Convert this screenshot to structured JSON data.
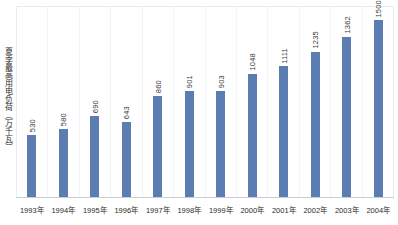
{
  "chart_data": {
    "type": "bar",
    "title": "",
    "subtitle": "",
    "xlabel": "",
    "ylabel": "夏季最高用电负荷（万千瓦）",
    "ylim": [
      0,
      1620
    ],
    "grid": "vertical-only",
    "legend": "none",
    "orientation": "vertical",
    "value_label_rotation": "90deg-vertical",
    "categories": [
      "1993年",
      "1994年",
      "1995年",
      "1996年",
      "1997年",
      "1998年",
      "1999年",
      "2000年",
      "2001年",
      "2002年",
      "2003年",
      "2004年"
    ],
    "values": [
      530,
      580,
      690,
      643,
      860,
      901,
      903,
      1048,
      1111,
      1235,
      1362,
      1500
    ],
    "points": [
      {
        "category": "1993年",
        "value": 530,
        "label": "530"
      },
      {
        "category": "1994年",
        "value": 580,
        "label": "580"
      },
      {
        "category": "1995年",
        "value": 690,
        "label": "690"
      },
      {
        "category": "1996年",
        "value": 643,
        "label": "643"
      },
      {
        "category": "1997年",
        "value": 860,
        "label": "860"
      },
      {
        "category": "1998年",
        "value": 901,
        "label": "901"
      },
      {
        "category": "1999年",
        "value": 903,
        "label": "903"
      },
      {
        "category": "2000年",
        "value": 1048,
        "label": "1048"
      },
      {
        "category": "2001年",
        "value": 1111,
        "label": "1111"
      },
      {
        "category": "2002年",
        "value": 1235,
        "label": "1235"
      },
      {
        "category": "2003年",
        "value": 1362,
        "label": "1362"
      },
      {
        "category": "2004年",
        "value": 1500,
        "label": "1500"
      }
    ],
    "colors": {
      "bar": "#5b7db1",
      "grid": "#f2f4f7",
      "frame": "#e9ecef",
      "axis_line": "#c9cdd4",
      "value_text": "#3a3a3a",
      "tick_text": "#2b2b2b",
      "background": "#ffffff"
    }
  }
}
